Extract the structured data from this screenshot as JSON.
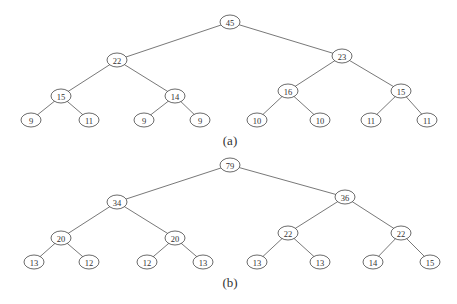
{
  "figure": {
    "trees": [
      {
        "id": "a",
        "caption": "(a)",
        "caption_pos": [
          230,
          140
        ],
        "nodes": [
          {
            "value": "45",
            "x": 230,
            "y": 22
          },
          {
            "value": "22",
            "x": 117,
            "y": 60
          },
          {
            "value": "23",
            "x": 342,
            "y": 56
          },
          {
            "value": "15",
            "x": 61,
            "y": 96
          },
          {
            "value": "14",
            "x": 175,
            "y": 96
          },
          {
            "value": "16",
            "x": 288,
            "y": 91
          },
          {
            "value": "15",
            "x": 401,
            "y": 91
          },
          {
            "value": "9",
            "x": 31,
            "y": 120
          },
          {
            "value": "11",
            "x": 89,
            "y": 120
          },
          {
            "value": "9",
            "x": 144,
            "y": 120
          },
          {
            "value": "9",
            "x": 200,
            "y": 120
          },
          {
            "value": "10",
            "x": 257,
            "y": 120
          },
          {
            "value": "10",
            "x": 320,
            "y": 120
          },
          {
            "value": "11",
            "x": 371,
            "y": 120
          },
          {
            "value": "11",
            "x": 427,
            "y": 120
          }
        ],
        "edges": [
          [
            0,
            1
          ],
          [
            0,
            2
          ],
          [
            1,
            3
          ],
          [
            1,
            4
          ],
          [
            2,
            5
          ],
          [
            2,
            6
          ],
          [
            3,
            7
          ],
          [
            3,
            8
          ],
          [
            4,
            9
          ],
          [
            4,
            10
          ],
          [
            5,
            11
          ],
          [
            5,
            12
          ],
          [
            6,
            13
          ],
          [
            6,
            14
          ]
        ]
      },
      {
        "id": "b",
        "caption": "(b)",
        "caption_pos": [
          230,
          282
        ],
        "nodes": [
          {
            "value": "79",
            "x": 230,
            "y": 165
          },
          {
            "value": "34",
            "x": 117,
            "y": 202
          },
          {
            "value": "36",
            "x": 345,
            "y": 197
          },
          {
            "value": "20",
            "x": 61,
            "y": 238
          },
          {
            "value": "20",
            "x": 175,
            "y": 238
          },
          {
            "value": "22",
            "x": 288,
            "y": 233
          },
          {
            "value": "22",
            "x": 401,
            "y": 233
          },
          {
            "value": "13",
            "x": 34,
            "y": 262
          },
          {
            "value": "12",
            "x": 89,
            "y": 262
          },
          {
            "value": "12",
            "x": 147,
            "y": 262
          },
          {
            "value": "13",
            "x": 203,
            "y": 262
          },
          {
            "value": "13",
            "x": 257,
            "y": 262
          },
          {
            "value": "13",
            "x": 320,
            "y": 262
          },
          {
            "value": "14",
            "x": 373,
            "y": 262
          },
          {
            "value": "15",
            "x": 430,
            "y": 262
          }
        ],
        "edges": [
          [
            0,
            1
          ],
          [
            0,
            2
          ],
          [
            1,
            3
          ],
          [
            1,
            4
          ],
          [
            2,
            5
          ],
          [
            2,
            6
          ],
          [
            3,
            7
          ],
          [
            3,
            8
          ],
          [
            4,
            9
          ],
          [
            4,
            10
          ],
          [
            5,
            11
          ],
          [
            5,
            12
          ],
          [
            6,
            13
          ],
          [
            6,
            14
          ]
        ]
      }
    ],
    "node_rx": 10,
    "node_ry": 7
  }
}
